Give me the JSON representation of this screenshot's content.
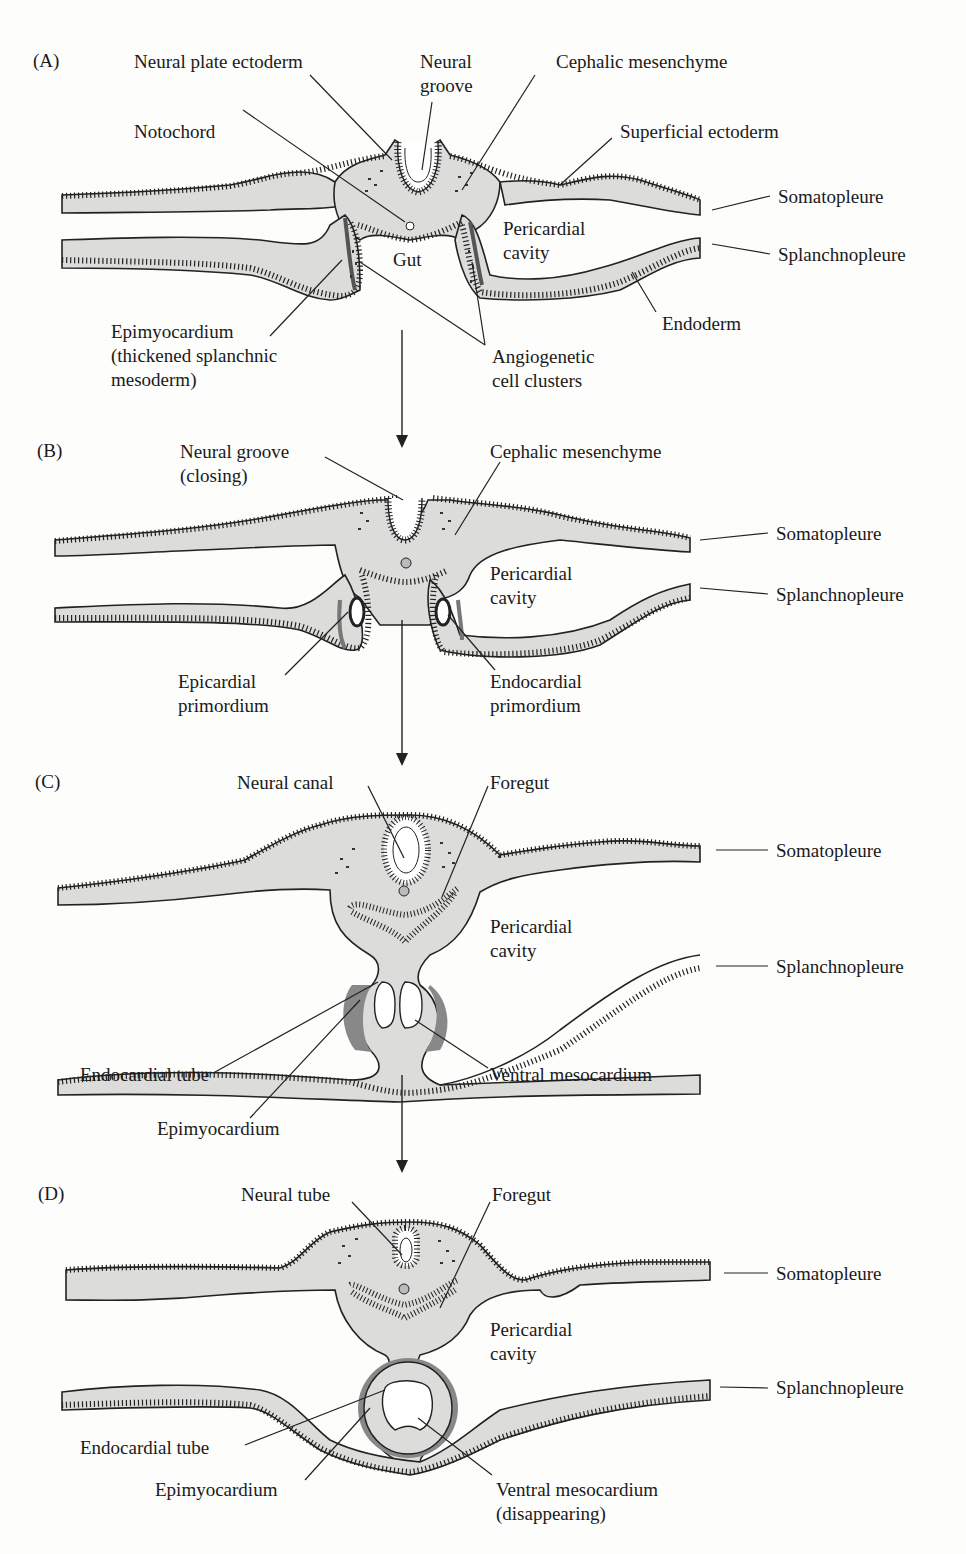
{
  "figure": {
    "panels": [
      {
        "id": "A",
        "letter": "(A)",
        "labels": {
          "neural_plate_ectoderm": "Neural plate ectoderm",
          "neural_groove_1": "Neural",
          "neural_groove_2": "groove",
          "cephalic_mesenchyme": "Cephalic mesenchyme",
          "notochord": "Notochord",
          "superficial_ectoderm": "Superficial ectoderm",
          "somatopleure": "Somatopleure",
          "pericardial_1": "Pericardial",
          "pericardial_2": "cavity",
          "gut": "Gut",
          "splanchnopleure": "Splanchnopleure",
          "endoderm": "Endoderm",
          "epimyocardium_1": "Epimyocardium",
          "epimyocardium_2": "(thickened splanchnic",
          "epimyocardium_3": "mesoderm)",
          "angiogenetic_1": "Angiogenetic",
          "angiogenetic_2": "cell clusters"
        }
      },
      {
        "id": "B",
        "letter": "(B)",
        "labels": {
          "neural_groove_1": "Neural groove",
          "neural_groove_2": "(closing)",
          "cephalic_mesenchyme": "Cephalic mesenchyme",
          "somatopleure": "Somatopleure",
          "pericardial_1": "Pericardial",
          "pericardial_2": "cavity",
          "splanchnopleure": "Splanchnopleure",
          "epicardial_1": "Epicardial",
          "epicardial_2": "primordium",
          "endocardial_1": "Endocardial",
          "endocardial_2": "primordium"
        }
      },
      {
        "id": "C",
        "letter": "(C)",
        "labels": {
          "neural_canal": "Neural canal",
          "foregut": "Foregut",
          "somatopleure": "Somatopleure",
          "pericardial_1": "Pericardial",
          "pericardial_2": "cavity",
          "splanchnopleure": "Splanchnopleure",
          "endocardial_tube": "Endocardial tube",
          "ventral_mesocardium": "Ventral mesocardium",
          "epimyocardium": "Epimyocardium"
        }
      },
      {
        "id": "D",
        "letter": "(D)",
        "labels": {
          "neural_tube": "Neural tube",
          "foregut": "Foregut",
          "somatopleure": "Somatopleure",
          "pericardial_1": "Pericardial",
          "pericardial_2": "cavity",
          "splanchnopleure": "Splanchnopleure",
          "endocardial_tube": "Endocardial tube",
          "epimyocardium": "Epimyocardium",
          "ventral_mesocardium_1": "Ventral mesocardium",
          "ventral_mesocardium_2": "(disappearing)"
        }
      }
    ],
    "colors": {
      "tissue_fill": "#dcdcda",
      "outline": "#222222",
      "myocardium_shadow": "#888888",
      "background": "#fdfdfc"
    }
  }
}
